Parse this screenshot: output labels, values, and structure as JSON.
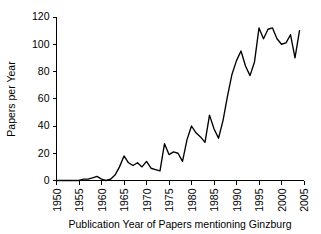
{
  "chart_data": {
    "type": "line",
    "title": "",
    "subtitle": "",
    "xlabel": "Publication Year of Papers mentioning Ginzburg",
    "ylabel": "Papers per Year",
    "xlim": [
      1950,
      2005
    ],
    "ylim": [
      0,
      120
    ],
    "grid": false,
    "legend": null,
    "legend_position": "none",
    "xticks": [
      1950,
      1955,
      1960,
      1965,
      1970,
      1975,
      1980,
      1985,
      1990,
      1995,
      2000,
      2005
    ],
    "yticks": [
      0,
      20,
      40,
      60,
      80,
      100,
      120
    ],
    "xtick_labels": [
      "1950",
      "1955",
      "1960",
      "1965",
      "1970",
      "1975",
      "1980",
      "1985",
      "1990",
      "1995",
      "2000",
      "2005"
    ],
    "ytick_labels": [
      "0",
      "20",
      "40",
      "60",
      "80",
      "100",
      "120"
    ],
    "line_color": "#000000",
    "series": [
      {
        "name": "Papers per Year",
        "x": [
          1950,
          1951,
          1952,
          1953,
          1954,
          1955,
          1956,
          1957,
          1958,
          1959,
          1960,
          1961,
          1962,
          1963,
          1964,
          1965,
          1966,
          1967,
          1968,
          1969,
          1970,
          1971,
          1972,
          1973,
          1974,
          1975,
          1976,
          1977,
          1978,
          1979,
          1980,
          1981,
          1982,
          1983,
          1984,
          1985,
          1986,
          1987,
          1988,
          1989,
          1990,
          1991,
          1992,
          1993,
          1994,
          1995,
          1996,
          1997,
          1998,
          1999,
          2000,
          2001,
          2002,
          2003,
          2004
        ],
        "values": [
          0,
          0,
          0,
          0,
          0,
          0,
          1,
          1,
          2,
          3,
          1,
          0,
          1,
          4,
          10,
          18,
          13,
          11,
          13,
          10,
          14,
          9,
          8,
          7,
          27,
          19,
          21,
          20,
          14,
          30,
          40,
          35,
          32,
          28,
          48,
          38,
          31,
          44,
          62,
          78,
          88,
          95,
          84,
          77,
          87,
          112,
          104,
          111,
          112,
          104,
          100,
          101,
          107,
          90,
          110
        ]
      }
    ]
  },
  "axes": {
    "y_title": "Papers per Year",
    "x_title": "Publication Year of Papers mentioning Ginzburg"
  }
}
